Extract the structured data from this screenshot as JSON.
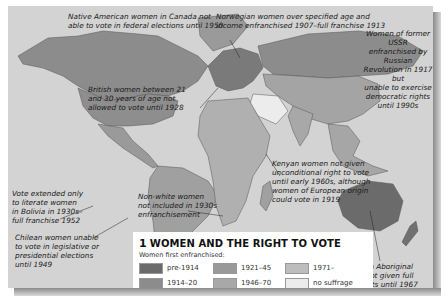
{
  "map": {
    "title_number": "1",
    "title": "Women and the Right to Vote",
    "title_display": "WOMEN AND THE RIGHT TO VOTE",
    "background_color": "#d3d3d3",
    "legend": {
      "subtitle": "Women first enfranchised:",
      "items": [
        {
          "label": "pre-1914",
          "color": "#6b6b6b"
        },
        {
          "label": "1914–20",
          "color": "#8c8c8c"
        },
        {
          "label": "1921–45",
          "color": "#999999"
        },
        {
          "label": "1946–70",
          "color": "#a8a8a8"
        },
        {
          "label": "1971–",
          "color": "#bdbdbd"
        },
        {
          "label": "no suffrage",
          "color": "#ececec"
        }
      ]
    },
    "annotations": [
      {
        "id": "canada",
        "text": "Native American women in Canada not able to vote in federal elections until 1950"
      },
      {
        "id": "norway",
        "text": "Norwegian women over specified age and income enfranchised 1907–full franchise 1913"
      },
      {
        "id": "ussr",
        "text": "Women of former USSR enfranchised by Russian Revolution in 1917 but unable to exercise democratic rights until 1990s"
      },
      {
        "id": "britain",
        "text": "British women between 21 and 30 years of age not allowed to vote until 1928"
      },
      {
        "id": "kenya",
        "text": "Kenyan women not given unconditional right to vote until early 1960s, although women of European origin could vote in 1919"
      },
      {
        "id": "bolivia",
        "text": "Vote extended only to literate women in Bolivia in 1930s–full franchise 1952"
      },
      {
        "id": "south-africa",
        "text": "Non-white women not included in 1930s enfranchisement"
      },
      {
        "id": "chile",
        "text": "Chilean women unable to vote in legislative or presidential elections until 1949"
      },
      {
        "id": "australia",
        "text": "Australian Aboriginal women not given full voting rights until 1967"
      }
    ],
    "lines": {
      "canada": [
        "Native American women in Canada not",
        "able to vote in federal elections until 1950"
      ],
      "norway": [
        "Norwegian women over specified age and",
        "income enfranchised 1907–full franchise 1913"
      ],
      "ussr": [
        "Women of former USSR",
        "enfranchised by Russian",
        "Revolution in 1917 but",
        "unable to exercise",
        "democratic rights",
        "until 1990s"
      ],
      "britain": [
        "British women between 21",
        "and 30 years of age not",
        "allowed to vote until 1928"
      ],
      "kenya": [
        "Kenyan women not given",
        "unconditional right to vote",
        "until early 1960s, although",
        "women of European origin",
        "could vote in 1919"
      ],
      "bolivia": [
        "Vote extended only",
        "to literate women",
        "in Bolivia in 1930s–",
        "full franchise 1952"
      ],
      "south_africa": [
        "Non-white women",
        "not included in 1930s",
        "enfranchisement"
      ],
      "chile": [
        "Chilean women unable",
        "to vote in legislative or",
        "presidential elections",
        "until 1949"
      ],
      "australia": [
        "Australian Aboriginal",
        "women not given full",
        "voting rights until 1967"
      ]
    }
  }
}
